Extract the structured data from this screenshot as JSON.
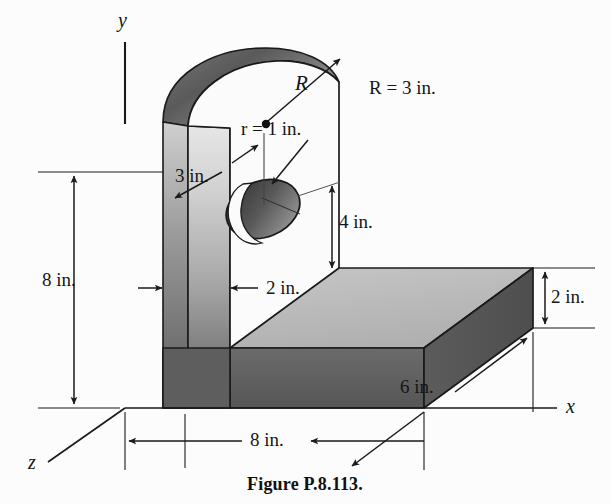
{
  "figure": {
    "caption": "Figure P.8.113.",
    "axes": [
      {
        "name": "y-axis",
        "label": "y"
      },
      {
        "name": "x-axis",
        "label": "x"
      },
      {
        "name": "z-axis",
        "label": "z"
      }
    ],
    "dimensions": [
      {
        "name": "arch-radius",
        "label": "R = 3 in.",
        "value": 3,
        "unit": "in.",
        "symbol": "R"
      },
      {
        "name": "radius-symbol",
        "label": "R",
        "value": 3,
        "unit": "in."
      },
      {
        "name": "hole-radius",
        "label": "r = 1 in.",
        "value": 1,
        "unit": "in.",
        "symbol": "r"
      },
      {
        "name": "arch-thickness",
        "label": "3 in.",
        "value": 3,
        "unit": "in."
      },
      {
        "name": "hole-height",
        "label": "4 in.",
        "value": 4,
        "unit": "in."
      },
      {
        "name": "wall-height",
        "label": "8 in.",
        "value": 8,
        "unit": "in."
      },
      {
        "name": "wall-thickness",
        "label": "2 in.",
        "value": 2,
        "unit": "in."
      },
      {
        "name": "base-thickness",
        "label": "2 in.",
        "value": 2,
        "unit": "in."
      },
      {
        "name": "base-length",
        "label": "8 in.",
        "value": 8,
        "unit": "in."
      },
      {
        "name": "base-depth",
        "label": "6 in.",
        "value": 6,
        "unit": "in."
      }
    ],
    "colors": {
      "line": "#1a1a1a",
      "top_face": "#b9b9b9",
      "front_face_dark": "#5e5e5e",
      "wall_light": "#d6d6d6",
      "wall_dark": "#6a6a6a",
      "arch_band_dark": "#555555",
      "hole_dark": "#4a4a4a",
      "background": "#fcfcfc"
    }
  }
}
